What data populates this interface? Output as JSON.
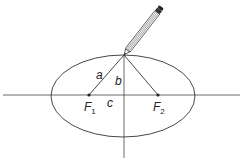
{
  "diagram": {
    "labels": {
      "a": "a",
      "b": "b",
      "c": "c",
      "f1": "F",
      "f1_sub": "1",
      "f2": "F",
      "f2_sub": "2"
    },
    "colors": {
      "stroke": "#333333",
      "background": "#ffffff"
    }
  }
}
